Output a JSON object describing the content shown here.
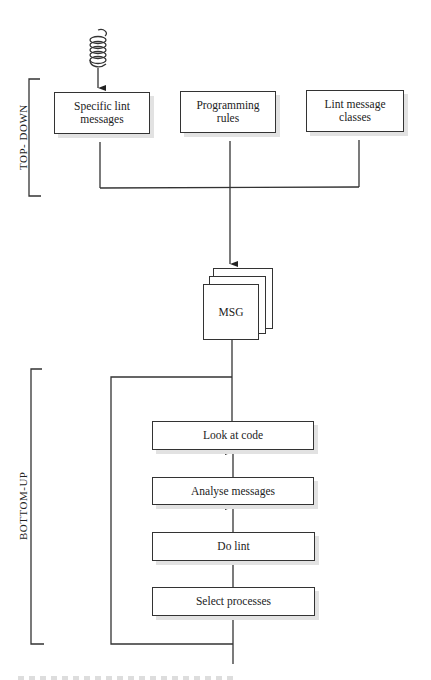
{
  "diagram": {
    "brackets": {
      "top_down_label": "TOP- DOWN",
      "bottom_up_label": "BOTTOM-UP"
    },
    "top_boxes": [
      {
        "label_line1": "Specific lint",
        "label_line2": "messages"
      },
      {
        "label_line1": "Programming",
        "label_line2": "rules"
      },
      {
        "label_line1": "Lint message",
        "label_line2": "classes"
      }
    ],
    "central_box": {
      "label": "MSG"
    },
    "steps": [
      {
        "label": "Look at code"
      },
      {
        "label": "Analyse messages"
      },
      {
        "label": "Do lint"
      },
      {
        "label": "Select processes"
      }
    ],
    "input_icon": "coil-spring-icon"
  }
}
